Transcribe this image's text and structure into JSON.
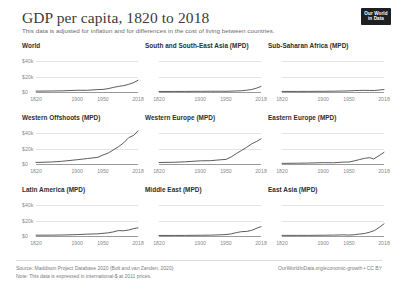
{
  "header": {
    "title": "GDP per capita, 1820 to 2018",
    "subtitle": "This data is adjusted for inflation and for differences in the cost of living between countries.",
    "logo_line1": "Our World",
    "logo_line2": "in Data"
  },
  "footer": {
    "source": "Source: Maddison Project Database 2020 (Bolt and van Zanden, 2020)",
    "note": "Note: This data is expressed in international-$ at 2011 prices.",
    "link": "OurWorldInData.org/economic-growth • CC BY"
  },
  "colors": {
    "line": "#4a4a4a",
    "gridline": "#e4e4e4",
    "axis": "#9a9a9a",
    "title_text": "#3b3b3b",
    "tick_text": "#8a8a8a",
    "logo_background": "#1d1f21"
  },
  "chart_data": {
    "type": "line",
    "title": "GDP per capita, 1820 to 2018",
    "subtitle": "This data is adjusted for inflation and for differences in the cost of living between countries.",
    "xlabel": "",
    "ylabel": "GDP per capita (international-$ at 2011 prices)",
    "xlim": [
      1820,
      2018
    ],
    "ylim": [
      0,
      48000
    ],
    "xticks": [
      1820,
      1900,
      1950,
      2018
    ],
    "xtick_labels": [
      "1820",
      "1900",
      "1950",
      "2018"
    ],
    "yticks": [
      0,
      20000,
      40000
    ],
    "ytick_labels": [
      "$0",
      "$20k",
      "$40k"
    ],
    "grid": true,
    "legend": "none",
    "facet_layout": [
      3,
      3
    ],
    "panels": [
      {
        "name": "World",
        "label": "World",
        "x": [
          1820,
          1850,
          1870,
          1900,
          1920,
          1940,
          1950,
          1960,
          1970,
          1980,
          1990,
          2000,
          2010,
          2018
        ],
        "values": [
          1102,
          1300,
          1498,
          2212,
          2241,
          3133,
          3351,
          4322,
          5922,
          7251,
          8225,
          9914,
          12349,
          15212
        ]
      },
      {
        "name": "South and South-East Asia",
        "label": "South and South-East Asia (MPD)",
        "x": [
          1820,
          1850,
          1870,
          1900,
          1920,
          1940,
          1950,
          1960,
          1970,
          1980,
          1990,
          2000,
          2010,
          2018
        ],
        "values": [
          726,
          715,
          750,
          883,
          957,
          960,
          891,
          1107,
          1335,
          1617,
          2324,
          3211,
          5144,
          7245
        ]
      },
      {
        "name": "Sub-Saharan Africa",
        "label": "Sub-Saharan Africa (MPD)",
        "x": [
          1820,
          1850,
          1870,
          1900,
          1920,
          1940,
          1950,
          1960,
          1970,
          1980,
          1990,
          2000,
          2010,
          2018
        ],
        "values": [
          741,
          760,
          779,
          904,
          1038,
          1300,
          1430,
          1752,
          2059,
          2136,
          1968,
          1944,
          2661,
          3202
        ]
      },
      {
        "name": "Western Offshoots",
        "label": "Western Offshoots (MPD)",
        "x": [
          1820,
          1850,
          1870,
          1900,
          1920,
          1940,
          1950,
          1960,
          1970,
          1980,
          1990,
          2000,
          2010,
          2018
        ],
        "values": [
          1980,
          2620,
          3491,
          5559,
          7096,
          8694,
          11721,
          14127,
          18196,
          22346,
          27394,
          34186,
          37340,
          42977
        ]
      },
      {
        "name": "Western Europe",
        "label": "Western Europe (MPD)",
        "x": [
          1820,
          1850,
          1870,
          1900,
          1920,
          1940,
          1950,
          1960,
          1970,
          1980,
          1990,
          2000,
          2010,
          2018
        ],
        "values": [
          1932,
          2280,
          2801,
          4107,
          4307,
          5501,
          5963,
          9095,
          13535,
          17463,
          21548,
          26185,
          29425,
          32689
        ]
      },
      {
        "name": "Eastern Europe",
        "label": "Eastern Europe (MPD)",
        "x": [
          1820,
          1850,
          1870,
          1900,
          1920,
          1940,
          1950,
          1960,
          1970,
          1980,
          1990,
          1998,
          2010,
          2018
        ],
        "values": [
          849,
          1018,
          1186,
          1730,
          1600,
          2500,
          2535,
          4000,
          5700,
          7300,
          8222,
          6500,
          11500,
          15148
        ]
      },
      {
        "name": "Latin America",
        "label": "Latin America (MPD)",
        "x": [
          1820,
          1850,
          1870,
          1900,
          1920,
          1940,
          1950,
          1960,
          1970,
          1980,
          1990,
          2000,
          2010,
          2018
        ],
        "values": [
          1045,
          1100,
          1311,
          1800,
          2400,
          2800,
          3446,
          4100,
          5300,
          7000,
          6800,
          7800,
          9700,
          10572
        ]
      },
      {
        "name": "Middle East",
        "label": "Middle East (MPD)",
        "x": [
          1820,
          1850,
          1870,
          1900,
          1920,
          1940,
          1950,
          1960,
          1970,
          1980,
          1990,
          2000,
          2010,
          2018
        ],
        "values": [
          700,
          720,
          780,
          950,
          1100,
          1600,
          1900,
          2700,
          4400,
          5600,
          5900,
          7300,
          10200,
          12100
        ]
      },
      {
        "name": "East Asia",
        "label": "East Asia (MPD)",
        "x": [
          1820,
          1850,
          1870,
          1900,
          1920,
          1940,
          1950,
          1960,
          1970,
          1980,
          1990,
          2000,
          2010,
          2018
        ],
        "values": [
          830,
          800,
          820,
          980,
          1200,
          1500,
          1200,
          1600,
          2500,
          3200,
          4900,
          7200,
          11800,
          15800
        ]
      }
    ]
  }
}
